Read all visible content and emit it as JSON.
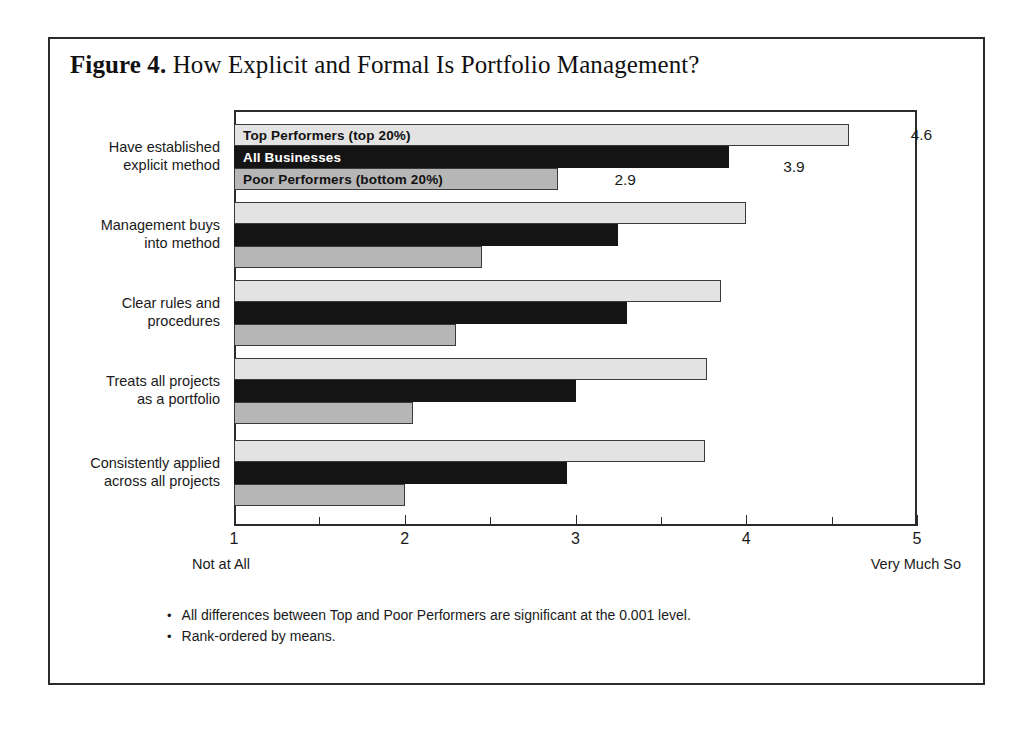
{
  "figure": {
    "number_label": "Figure 4.",
    "title": "How Explicit and Formal Is Portfolio Management?"
  },
  "footnotes": {
    "bullet_glyph": "•",
    "items": [
      "All differences between Top and Poor Performers are significant at the 0.001 level.",
      "Rank-ordered by means."
    ]
  },
  "axis": {
    "left_end_label": "Not at All",
    "right_end_label": "Very Much So",
    "tick_labels": [
      "1",
      "2",
      "3",
      "4",
      "5"
    ]
  },
  "chart_data": {
    "type": "bar",
    "orientation": "horizontal",
    "title": "How Explicit and Formal Is Portfolio Management?",
    "xlabel": "",
    "ylabel": "",
    "xlim": [
      1,
      5
    ],
    "xticks": [
      1,
      2,
      3,
      4,
      5
    ],
    "xtick_labels": [
      "1",
      "2",
      "3",
      "4",
      "5"
    ],
    "minor_xticks": [
      1.5,
      2.5,
      3.5,
      4.5
    ],
    "xtick_end_annotations": {
      "left": "Not at All",
      "right": "Very Much So"
    },
    "grid": false,
    "legend_position": "inside-first-group-bars",
    "categories": [
      "Have established\nexplicit method",
      "Management buys\ninto method",
      "Clear rules and\nprocedures",
      "Treats all projects\nas a portfolio",
      "Consistently applied\nacross all projects"
    ],
    "series": [
      {
        "name": "Top Performers (top 20%)",
        "color": "#e3e3e3",
        "values": [
          4.6,
          4.0,
          3.85,
          3.77,
          3.76
        ],
        "labels": [
          "4.6",
          "",
          "",
          "",
          ""
        ]
      },
      {
        "name": "All Businesses",
        "color": "#141414",
        "values": [
          3.9,
          3.25,
          3.3,
          3.0,
          2.95
        ],
        "labels": [
          "3.9",
          "",
          "",
          "",
          ""
        ]
      },
      {
        "name": "Poor Performers (bottom 20%)",
        "color": "#b6b6b6",
        "values": [
          2.9,
          2.45,
          2.3,
          2.05,
          2.0
        ],
        "labels": [
          "2.9",
          "",
          "",
          "",
          ""
        ]
      }
    ],
    "annotations": [
      "All differences between Top and Poor Performers are significant at the 0.001 level.",
      "Rank-ordered by means."
    ]
  }
}
